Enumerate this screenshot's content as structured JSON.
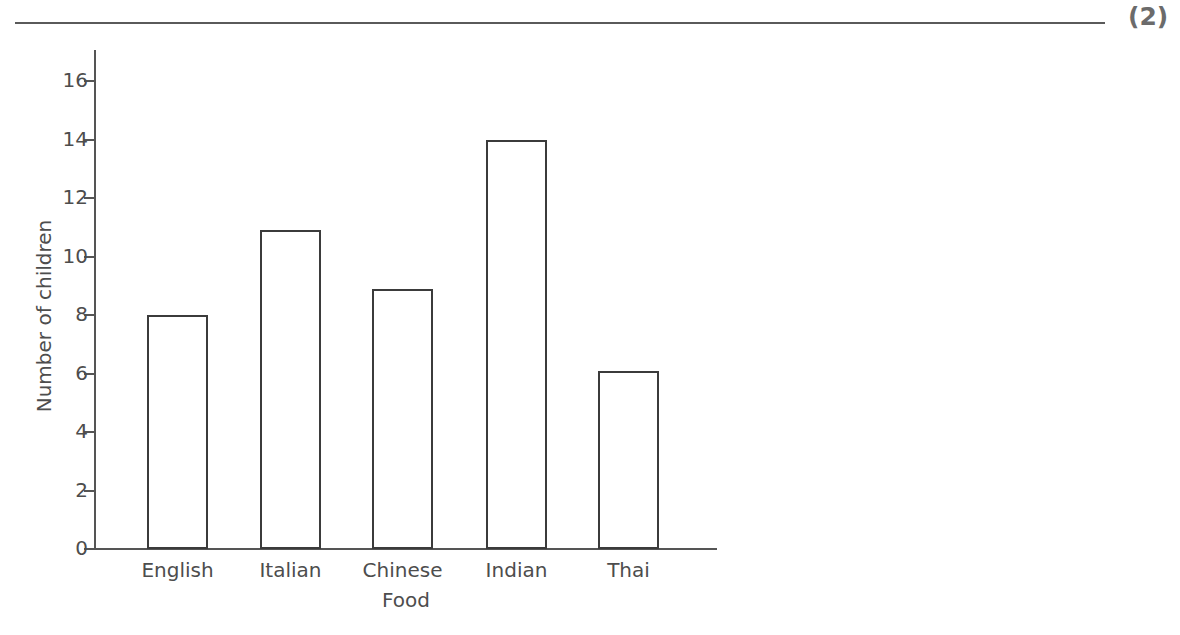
{
  "page": {
    "marks_indicator": "(2)",
    "rule_color": "#5a5a5a"
  },
  "chart_data": {
    "type": "bar",
    "title": "",
    "subtitle": "",
    "xlabel": "Food",
    "ylabel": "Number of children",
    "categories": [
      "English",
      "Italian",
      "Chinese",
      "Indian",
      "Thai"
    ],
    "values": [
      8,
      10.9,
      8.9,
      14,
      6.1
    ],
    "ylim": [
      0,
      17
    ],
    "ytick_labels": [
      "16",
      "14",
      "12",
      "10",
      "8",
      "6",
      "4",
      "2",
      "0"
    ],
    "ytick_values": [
      16,
      14,
      12,
      10,
      8,
      6,
      4,
      2,
      0
    ],
    "grid": false,
    "legend": false,
    "bar_fill_color": "#ffffff",
    "bar_edge_color": "#3b3b3b",
    "axis_color": "#555555",
    "text_color": "#4d4d4d"
  },
  "axis_labels": {
    "y_title": "Number of children",
    "x_title": "Food"
  }
}
